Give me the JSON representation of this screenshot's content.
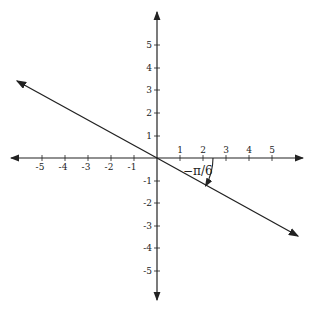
{
  "diagram": {
    "type": "coordinate-plane",
    "x_ticks": [
      "-5",
      "-4",
      "-3",
      "-2",
      "-1",
      "1",
      "2",
      "3",
      "4",
      "5"
    ],
    "y_ticks": [
      "5",
      "4",
      "3",
      "2",
      "1",
      "-1",
      "-2",
      "-3",
      "-4",
      "-5"
    ],
    "angle_label": "−π/6",
    "line": {
      "angle": "-pi/6",
      "through": "origin"
    },
    "colors": {
      "stroke": "#222222",
      "background": "#ffffff"
    }
  }
}
